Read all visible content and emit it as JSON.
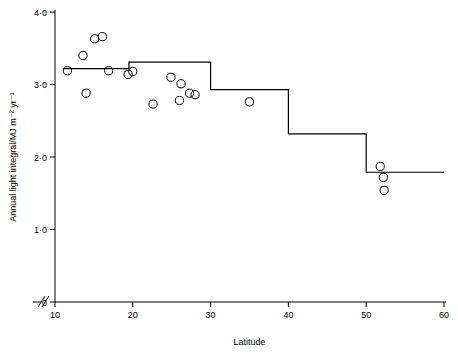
{
  "chart_data": {
    "type": "scatter",
    "title": "",
    "xlabel": "Latitude",
    "ylabel": "Annual light integral/MJ m⁻² yr⁻¹",
    "xlim": [
      10,
      60
    ],
    "ylim": [
      0,
      4.0
    ],
    "axis_break_x": true,
    "grid": false,
    "legend": "none",
    "xticks": [
      10,
      20,
      30,
      40,
      50,
      60
    ],
    "xticklabels": [
      "10",
      "20",
      "30",
      "40",
      "50",
      "60"
    ],
    "yticks": [
      0,
      1.0,
      2.0,
      3.0,
      4.0
    ],
    "yticklabels": [
      "0",
      "1·0",
      "2·0",
      "3·0",
      "4·0"
    ],
    "series": [
      {
        "name": "observations",
        "type": "scatter",
        "marker": "open-circle",
        "points": [
          {
            "x": 11.6,
            "y": 3.19
          },
          {
            "x": 13.6,
            "y": 3.4
          },
          {
            "x": 14.0,
            "y": 2.88
          },
          {
            "x": 15.1,
            "y": 3.63
          },
          {
            "x": 16.1,
            "y": 3.66
          },
          {
            "x": 16.9,
            "y": 3.19
          },
          {
            "x": 19.4,
            "y": 3.14
          },
          {
            "x": 20.0,
            "y": 3.18
          },
          {
            "x": 22.6,
            "y": 2.73
          },
          {
            "x": 24.9,
            "y": 3.1
          },
          {
            "x": 26.0,
            "y": 2.78
          },
          {
            "x": 26.2,
            "y": 3.01
          },
          {
            "x": 27.3,
            "y": 2.88
          },
          {
            "x": 28.0,
            "y": 2.86
          },
          {
            "x": 35.0,
            "y": 2.76
          },
          {
            "x": 51.8,
            "y": 1.87
          },
          {
            "x": 52.2,
            "y": 1.72
          },
          {
            "x": 52.3,
            "y": 1.54
          }
        ]
      },
      {
        "name": "step-function",
        "type": "step",
        "steps": [
          {
            "x_start": 11.0,
            "x_end": 19.5,
            "y": 3.22
          },
          {
            "x_start": 19.5,
            "x_end": 30.0,
            "y": 3.31
          },
          {
            "x_start": 30.0,
            "x_end": 40.0,
            "y": 2.93
          },
          {
            "x_start": 40.0,
            "x_end": 50.0,
            "y": 2.32
          },
          {
            "x_start": 50.0,
            "x_end": 60.0,
            "y": 1.79
          }
        ]
      }
    ]
  }
}
